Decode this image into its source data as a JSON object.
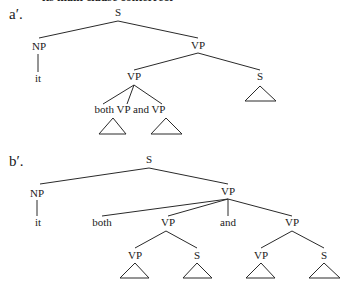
{
  "cut_off_header": "its main clause conterrect",
  "trees": [
    {
      "label": "a′.",
      "nodes": {
        "S": "S",
        "NP": "NP",
        "it": "it",
        "VP_top": "VP",
        "VP_mid": "VP",
        "S_right": "S",
        "coord_text": "both VP and VP"
      }
    },
    {
      "label": "b′.",
      "nodes": {
        "S": "S",
        "NP": "NP",
        "it": "it",
        "VP_top": "VP",
        "both": "both",
        "and": "and",
        "VP_left": "VP",
        "VP_right": "VP",
        "VP_ll": "VP",
        "S_lr": "S",
        "VP_rl": "VP",
        "S_rr": "S"
      }
    }
  ]
}
